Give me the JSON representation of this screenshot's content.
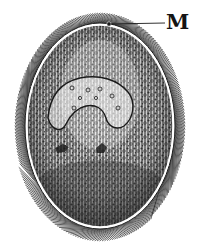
{
  "figure": {
    "labels": [
      {
        "id": "M",
        "text": "M",
        "points_to": "mouth (cytostome) at anterior end"
      }
    ]
  },
  "colors": {
    "background": "#ffffff",
    "ink": "#141414",
    "body_fill": "#6e6e6e"
  }
}
